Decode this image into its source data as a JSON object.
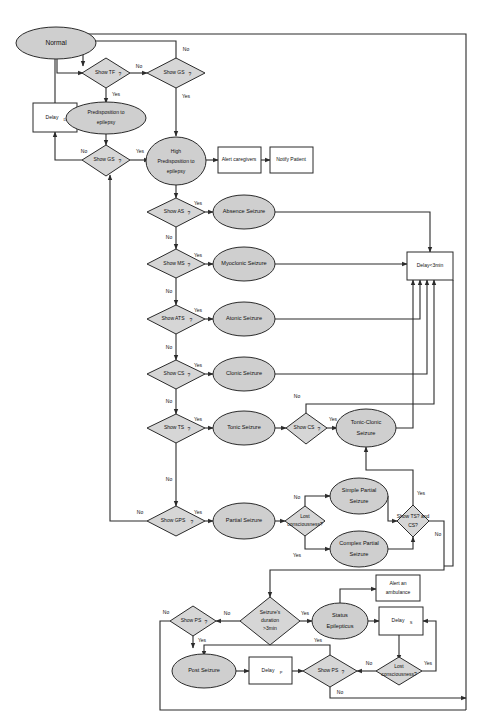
{
  "diagram": {
    "colors": {
      "node_fill": "#cfcfcf",
      "decision_fill": "#d6d6d6",
      "process_fill": "#ffffff",
      "stroke": "#2b2b2b",
      "background": "#ffffff"
    },
    "nodes": {
      "normal": "Normal",
      "predisposition": "Predisposition to epilepsy",
      "predisposition_l1": "Predisposition to",
      "predisposition_l2": "epilepsy",
      "high_predisposition_l1": "High",
      "high_predisposition_l2": "Predisposition to",
      "high_predisposition_l3": "epilepsy",
      "alert_caregivers": "Alert caregivers",
      "notify_patient": "Notify Patient",
      "absence_seizure": "Absence Seizure",
      "myoclonic_seizure": "Myoclonic Seizure",
      "atonic_seizure": "Atonic Seizure",
      "clonic_seizure": "Clonic Seizure",
      "tonic_seizure": "Tonic Seizure",
      "tonic_clonic_l1": "Tonic-Clonic",
      "tonic_clonic_l2": "Seizure",
      "partial_seizure": "Partial Seizure",
      "simple_partial_l1": "Simple Partial",
      "simple_partial_l2": "Seizure",
      "complex_partial_l1": "Complex Partial",
      "complex_partial_l2": "Seizure",
      "status_epilepticus_l1": "Status",
      "status_epilepticus_l2": "Epilepticus",
      "alert_ambulance_l1": "Alert an",
      "alert_ambulance_l2": "ambulance",
      "post_seizure": "Post Seizure",
      "delay_d": "Delay",
      "delay_d_sub": "D",
      "delay_3min": "Delay<3min",
      "delay_s": "Delay",
      "delay_s_sub": "S",
      "delay_p": "Delay",
      "delay_p_sub": "P"
    },
    "decisions": {
      "show_tf": "Show TF",
      "show_tf_sub": "?",
      "show_gs_top": "Show GS",
      "show_gs_top_sub": "?",
      "show_gs_mid": "Show GS",
      "show_gs_mid_sub": "?",
      "show_as": "Show AS",
      "show_as_sub": "?",
      "show_ms": "Show MS",
      "show_ms_sub": "?",
      "show_ats": "Show ATS",
      "show_ats_sub": "?",
      "show_cs": "Show CS",
      "show_cs_sub": "?",
      "show_ts": "Show TS",
      "show_ts_sub": "?",
      "show_cs2": "Show CS",
      "show_cs2_sub": "?",
      "show_gps": "Show GPS",
      "show_gps_sub": "?",
      "lost_consciousness_l1": "Lost",
      "lost_consciousness_l2": "consciousness?",
      "show_ts_and_cs_l1": "Show TS? and",
      "show_ts_and_cs_l2": "CS?",
      "seizure_duration_l1": "Seizure's",
      "seizure_duration_l2": "duration",
      "seizure_duration_l3": ">3min",
      "show_ps_left": "Show PS",
      "show_ps_left_sub": "?",
      "show_ps_bottom": "Show PS",
      "show_ps_bottom_sub": "?",
      "lost_consciousness2_l1": "Lost",
      "lost_consciousness2_l2": "consciousness?"
    },
    "edge_labels": {
      "yes": "Yes",
      "no": "No"
    }
  }
}
